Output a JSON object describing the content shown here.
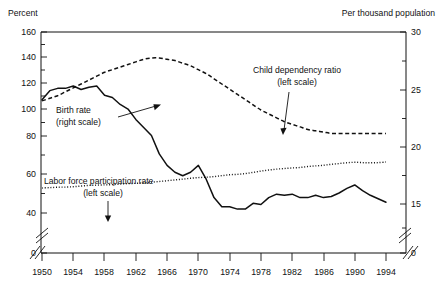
{
  "chart_data": {
    "type": "line",
    "title": "",
    "xlabel": "",
    "ylabel": "Percent",
    "y2label": "Per thousand population",
    "left_axis_title": "Percent",
    "right_axis_title": "Per thousand population",
    "grid": false,
    "legend_position": "inline-annotations",
    "axis_break_left": true,
    "axis_break_right": true,
    "axis_break_x_start": true,
    "axis_break_x_end": true,
    "xlim": [
      1949,
      1995
    ],
    "ylim_left": [
      36,
      160
    ],
    "ylim_right": [
      13.5,
      30
    ],
    "x_tick_labels": [
      "1950",
      "1954",
      "1958",
      "1962",
      "1966",
      "1970",
      "1974",
      "1978",
      "1982",
      "1986",
      "1990",
      "1994"
    ],
    "x_ticks": [
      1950,
      1954,
      1958,
      1962,
      1966,
      1970,
      1974,
      1978,
      1982,
      1986,
      1990,
      1994
    ],
    "y_left_tick_labels": [
      "0",
      "40",
      "60",
      "80",
      "100",
      "120",
      "140",
      "160"
    ],
    "y_left_ticks": [
      0,
      40,
      60,
      80,
      100,
      120,
      140,
      160
    ],
    "y_left_minor_ticks": [
      50,
      70,
      90,
      110,
      130,
      150
    ],
    "y_right_tick_labels": [
      "0",
      "15",
      "20",
      "25",
      "30"
    ],
    "y_right_ticks": [
      0,
      15,
      20,
      25,
      30
    ],
    "y_right_minor_ticks": [
      17.5,
      22.5,
      27.5
    ],
    "series": [
      {
        "name": "Child dependency ratio",
        "scale": "left",
        "style": "dashed",
        "label": "Child dependency ratio",
        "sublabel": "(left scale)",
        "x": [
          1950,
          1951,
          1952,
          1953,
          1954,
          1955,
          1956,
          1957,
          1958,
          1959,
          1960,
          1961,
          1962,
          1963,
          1964,
          1965,
          1966,
          1967,
          1968,
          1969,
          1970,
          1971,
          1972,
          1973,
          1974,
          1975,
          1976,
          1977,
          1978,
          1979,
          1980,
          1981,
          1982,
          1983,
          1984,
          1985,
          1986,
          1987,
          1988,
          1989,
          1990,
          1991,
          1992,
          1993,
          1994
        ],
        "values": [
          107,
          109,
          111,
          114,
          117,
          120,
          123,
          126,
          129,
          131,
          133,
          135,
          137,
          139,
          140,
          140,
          139,
          138,
          136,
          134,
          131,
          128,
          124,
          120,
          116,
          112,
          108,
          104,
          100,
          97,
          94,
          91,
          89,
          87,
          85,
          84,
          83,
          82,
          82,
          82,
          82,
          82,
          82,
          82,
          82
        ]
      },
      {
        "name": "Birth rate",
        "scale": "right",
        "style": "solid",
        "label": "Birth rate",
        "sublabel": "(right scale)",
        "x": [
          1950,
          1951,
          1952,
          1953,
          1954,
          1955,
          1956,
          1957,
          1958,
          1959,
          1960,
          1961,
          1962,
          1963,
          1964,
          1965,
          1966,
          1967,
          1968,
          1969,
          1970,
          1971,
          1972,
          1973,
          1974,
          1975,
          1976,
          1977,
          1978,
          1979,
          1980,
          1981,
          1982,
          1983,
          1984,
          1985,
          1986,
          1987,
          1988,
          1989,
          1990,
          1991,
          1992,
          1993,
          1994
        ],
        "values": [
          24.1,
          24.9,
          25.1,
          25.1,
          25.3,
          25.0,
          25.2,
          25.3,
          24.5,
          24.3,
          23.7,
          23.3,
          22.4,
          21.7,
          21.0,
          19.4,
          18.4,
          17.8,
          17.5,
          17.8,
          18.4,
          17.2,
          15.6,
          14.8,
          14.8,
          14.6,
          14.6,
          15.1,
          15.0,
          15.6,
          15.9,
          15.8,
          15.9,
          15.6,
          15.6,
          15.8,
          15.6,
          15.7,
          16.0,
          16.4,
          16.7,
          16.2,
          15.8,
          15.5,
          15.2
        ]
      },
      {
        "name": "Labor force participation rate",
        "scale": "left",
        "style": "dotted",
        "label": "Labor force participation rate",
        "sublabel": "(left scale)",
        "x": [
          1950,
          1951,
          1952,
          1953,
          1954,
          1955,
          1956,
          1957,
          1958,
          1959,
          1960,
          1961,
          1962,
          1963,
          1964,
          1965,
          1966,
          1967,
          1968,
          1969,
          1970,
          1971,
          1972,
          1973,
          1974,
          1975,
          1976,
          1977,
          1978,
          1979,
          1980,
          1981,
          1982,
          1983,
          1984,
          1985,
          1986,
          1987,
          1988,
          1989,
          1990,
          1991,
          1992,
          1993,
          1994
        ],
        "values": [
          40.0,
          40.3,
          40.6,
          40.7,
          41.0,
          41.5,
          42.0,
          42.2,
          42.4,
          42.6,
          43.0,
          43.4,
          43.6,
          44.0,
          44.5,
          45.0,
          45.6,
          46.2,
          46.8,
          47.5,
          48.0,
          48.3,
          48.8,
          49.5,
          50.2,
          50.5,
          51.1,
          52.0,
          53.0,
          53.8,
          54.5,
          55.0,
          55.4,
          55.8,
          56.5,
          57.0,
          57.5,
          58.2,
          58.8,
          59.4,
          59.8,
          59.5,
          59.4,
          59.5,
          60.0
        ]
      }
    ],
    "annotations": [
      {
        "name": "child-dependency-annotation",
        "line1": "Child dependency ratio",
        "line2": "(left scale)"
      },
      {
        "name": "birth-rate-annotation",
        "line1": "Birth rate",
        "line2": "(right scale)"
      },
      {
        "name": "labor-force-annotation",
        "line1": "Labor force participation rate",
        "line2": "(left scale)"
      }
    ],
    "colors": {
      "axis": "#111111",
      "series": "#111111",
      "background": "#ffffff"
    }
  }
}
